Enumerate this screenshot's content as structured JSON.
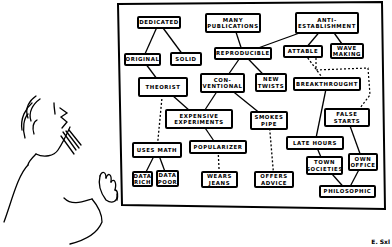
{
  "nodes": [
    {
      "id": "dedicated",
      "label": "DEDICATED",
      "x": 137,
      "y": 16,
      "w": 44,
      "h": 13
    },
    {
      "id": "many_publications",
      "label": "MANY\nPUBLICATIONS",
      "x": 205,
      "y": 13,
      "w": 56,
      "h": 20
    },
    {
      "id": "anti_establishment",
      "label": "ANTI-\nESTABLISHMENT",
      "x": 295,
      "y": 12,
      "w": 64,
      "h": 22
    },
    {
      "id": "original",
      "label": "ORIGINAL",
      "x": 124,
      "y": 53,
      "w": 37,
      "h": 13
    },
    {
      "id": "solid",
      "label": "SOLID",
      "x": 170,
      "y": 52,
      "w": 32,
      "h": 14
    },
    {
      "id": "reproducible",
      "label": "REPRODUCIBLE",
      "x": 214,
      "y": 47,
      "w": 58,
      "h": 13
    },
    {
      "id": "attable",
      "label": "ATTABLE",
      "x": 283,
      "y": 45,
      "w": 40,
      "h": 13
    },
    {
      "id": "wave_making",
      "label": "WAVE\nMAKING",
      "x": 330,
      "y": 43,
      "w": 34,
      "h": 16
    },
    {
      "id": "theorist",
      "label": "THEORIST",
      "x": 138,
      "y": 77,
      "w": 50,
      "h": 20
    },
    {
      "id": "conventional",
      "label": "CON-\nVENTIONAL",
      "x": 200,
      "y": 73,
      "w": 45,
      "h": 20
    },
    {
      "id": "new_twists",
      "label": "NEW\nTWISTS",
      "x": 255,
      "y": 73,
      "w": 32,
      "h": 19
    },
    {
      "id": "breakthrough",
      "label": "BREAKTHROUGHT",
      "x": 293,
      "y": 77,
      "w": 68,
      "h": 14
    },
    {
      "id": "expensive_experiments",
      "label": "EXPENSIVE\nEXPERIMENTS",
      "x": 165,
      "y": 109,
      "w": 68,
      "h": 20
    },
    {
      "id": "smokes_pipe",
      "label": "SMOKES\nPIPE",
      "x": 250,
      "y": 111,
      "w": 38,
      "h": 19
    },
    {
      "id": "false_starts",
      "label": "FALSE\nSTARTS",
      "x": 324,
      "y": 108,
      "w": 46,
      "h": 19
    },
    {
      "id": "uses_math",
      "label": "USES MATH",
      "x": 132,
      "y": 142,
      "w": 50,
      "h": 16
    },
    {
      "id": "popularizer",
      "label": "POPULARIZER",
      "x": 189,
      "y": 140,
      "w": 58,
      "h": 14
    },
    {
      "id": "late_hours",
      "label": "LATE HOURS",
      "x": 286,
      "y": 136,
      "w": 58,
      "h": 14
    },
    {
      "id": "town_societies",
      "label": "TOWN\nSOCIETIES",
      "x": 306,
      "y": 156,
      "w": 37,
      "h": 19
    },
    {
      "id": "own_office",
      "label": "OWN\nOFFICE",
      "x": 348,
      "y": 153,
      "w": 30,
      "h": 18
    },
    {
      "id": "data_rich",
      "label": "DATA\nRICH",
      "x": 132,
      "y": 171,
      "w": 21,
      "h": 16
    },
    {
      "id": "data_poor",
      "label": "DATA\nPOOR",
      "x": 156,
      "y": 170,
      "w": 23,
      "h": 17
    },
    {
      "id": "wears_jeans",
      "label": "WEARS\nJEANS",
      "x": 201,
      "y": 171,
      "w": 37,
      "h": 17
    },
    {
      "id": "offers_advice",
      "label": "OFFERS\nADVICE",
      "x": 254,
      "y": 171,
      "w": 40,
      "h": 17
    },
    {
      "id": "philosophic",
      "label": "PHILOSOPHIC",
      "x": 319,
      "y": 185,
      "w": 57,
      "h": 13
    }
  ],
  "edges": {
    "solid": [
      [
        "dedicated",
        "original"
      ],
      [
        "dedicated",
        "solid"
      ],
      [
        "many_publications",
        "reproducible"
      ],
      [
        "anti_establishment",
        "reproducible"
      ],
      [
        "anti_establishment",
        "attable"
      ],
      [
        "anti_establishment",
        "wave_making"
      ],
      [
        "original",
        "theorist"
      ],
      [
        "reproducible",
        "conventional"
      ],
      [
        "reproducible",
        "new_twists"
      ],
      [
        "theorist",
        "expensive_experiments"
      ],
      [
        "conventional",
        "expensive_experiments"
      ],
      [
        "conventional",
        "smokes_pipe"
      ],
      [
        "expensive_experiments",
        "popularizer"
      ],
      [
        "breakthrough",
        "late_hours"
      ],
      [
        "false_starts",
        "own_office"
      ],
      [
        "uses_math",
        "data_rich"
      ],
      [
        "uses_math",
        "data_poor"
      ],
      [
        "late_hours",
        "town_societies"
      ],
      [
        "town_societies",
        "philosophic"
      ],
      [
        "own_office",
        "philosophic"
      ]
    ],
    "dashed": [
      [
        "attable",
        "breakthrough"
      ],
      [
        "theorist",
        "uses_math"
      ],
      [
        "popularizer",
        "wears_jeans"
      ],
      [
        "smokes_pipe",
        "offers_advice"
      ]
    ]
  },
  "board": {
    "stroke": "#000000",
    "background": "#ffffff"
  },
  "signature": "E. Sxl"
}
